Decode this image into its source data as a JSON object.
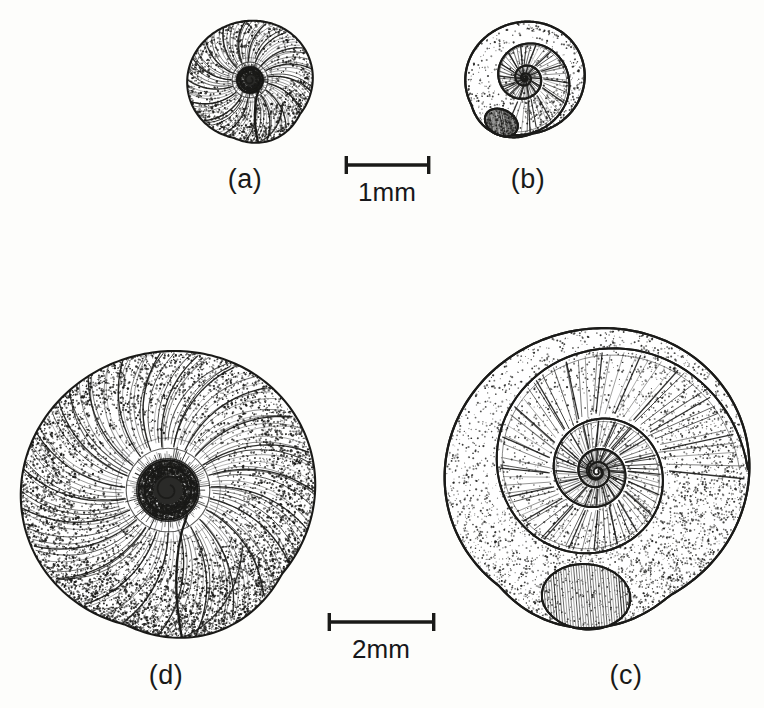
{
  "plate": {
    "kind": "scientific-illustration-plate",
    "subject": "gastropod shells",
    "background_color": "#fdfdfb",
    "ink_color": "#1a1a18",
    "width": 764,
    "height": 708
  },
  "specimens": [
    {
      "id": "a",
      "label": "(a)",
      "label_x": 528,
      "label_y": 182,
      "center_x": 525,
      "center_y": 78,
      "radius": 58,
      "scale_group": "1mm",
      "style": "coiled-spiral-whorls",
      "whorl_count": 3.5,
      "aperture_angle_deg": 118,
      "dark_center": false,
      "rib_count": 150
    },
    {
      "id": "b",
      "label": "(b)",
      "label_x": 245,
      "label_y": 182,
      "center_x": 250,
      "center_y": 80,
      "radius": 61,
      "scale_group": "1mm",
      "style": "stippled-radial-ribs",
      "whorl_count": 2.2,
      "aperture_angle_deg": 70,
      "dark_center": true,
      "rib_count": 70
    },
    {
      "id": "c",
      "label": "(c)",
      "label_x": 626,
      "label_y": 678,
      "center_x": 597,
      "center_y": 472,
      "radius": 148,
      "scale_group": "2mm",
      "style": "coiled-spiral-whorls",
      "whorl_count": 4.2,
      "aperture_angle_deg": 95,
      "dark_center": false,
      "rib_count": 260
    },
    {
      "id": "d",
      "label": "(d)",
      "label_x": 166,
      "label_y": 678,
      "center_x": 168,
      "center_y": 490,
      "radius": 143,
      "scale_group": "2mm",
      "style": "stippled-radial-ribs",
      "whorl_count": 2.6,
      "aperture_angle_deg": 72,
      "dark_center": true,
      "rib_count": 96
    }
  ],
  "scale_bars": [
    {
      "id": "scale-1mm",
      "label": "1mm",
      "x1": 345,
      "x2": 430,
      "y": 165,
      "cap_height": 18,
      "label_x": 387,
      "label_y": 183,
      "applies_to": [
        "a",
        "b"
      ]
    },
    {
      "id": "scale-2mm",
      "label": "2mm",
      "x1": 328,
      "x2": 435,
      "y": 622,
      "cap_height": 18,
      "label_x": 381,
      "label_y": 640,
      "applies_to": [
        "c",
        "d"
      ]
    }
  ]
}
